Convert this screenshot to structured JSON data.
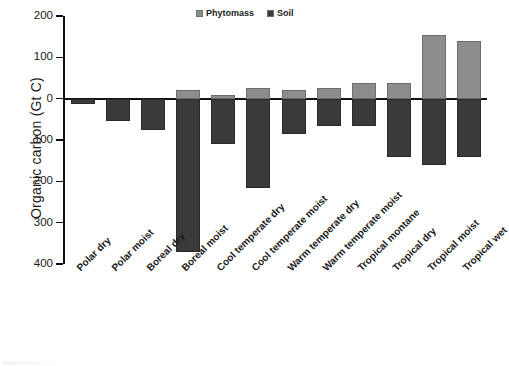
{
  "chart_data": {
    "type": "bar",
    "title": "",
    "xlabel": "",
    "ylabel": "Organic carbon (Gt C)",
    "grid": false,
    "legend_position": "top-center",
    "axis_note": "Y axis displays absolute magnitudes; values below the zero line are negative (soil) and shown with positive tick labels.",
    "ylim": [
      -400,
      200
    ],
    "yticks": [
      200,
      100,
      0,
      -100,
      -200,
      -300,
      -400
    ],
    "ytick_labels": [
      "200",
      "100",
      "0",
      "100",
      "200",
      "300",
      "400"
    ],
    "categories": [
      "Polar dry",
      "Polar moist",
      "Boreal dry",
      "Boreal moist",
      "Cool temperate dry",
      "Cool temperate moist",
      "Warm temperate dry",
      "Warm temperate moist",
      "Tropical montane",
      "Tropical dry",
      "Tropical moist",
      "Tropical wet"
    ],
    "series": [
      {
        "name": "Phytomass",
        "color": "#8d8d8d",
        "values": [
          0,
          0,
          0,
          21,
          8,
          25,
          20,
          25,
          38,
          38,
          155,
          140
        ]
      },
      {
        "name": "Soil",
        "color": "#3a3a3a",
        "values": [
          -13,
          -55,
          -75,
          -370,
          -110,
          -215,
          -85,
          -65,
          -65,
          -140,
          -160,
          -140
        ]
      }
    ]
  },
  "legend": {
    "entries": [
      {
        "label": "Phytomass",
        "color": "#8d8d8d"
      },
      {
        "label": "Soil",
        "color": "#3a3a3a"
      }
    ]
  },
  "axes": {
    "y_title": "Organic carbon (Gt C)"
  }
}
